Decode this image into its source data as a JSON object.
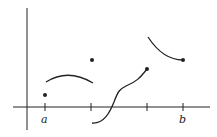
{
  "diagram": {
    "axis_labels": {
      "a": "a",
      "b": "b"
    },
    "colors": {
      "stroke": "#222222",
      "background": "#ffffff"
    }
  }
}
